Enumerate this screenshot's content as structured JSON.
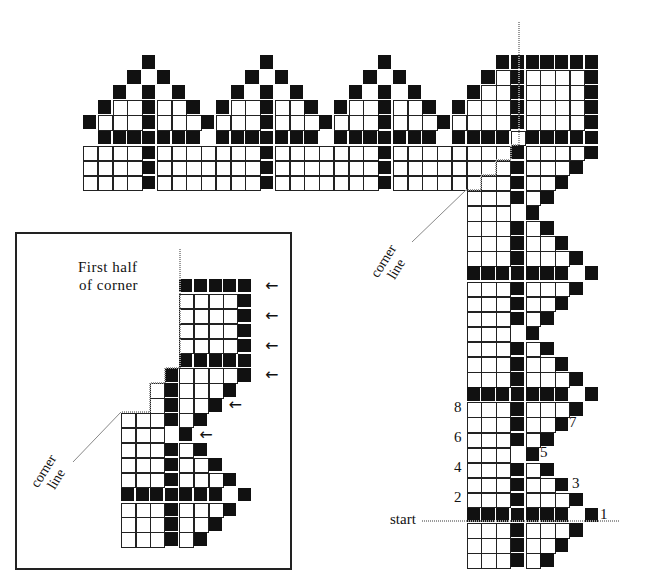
{
  "diagram": {
    "colors": {
      "filled": "#111111",
      "empty_cell_border": "#222222",
      "guide_line": "#999999"
    },
    "main_chart": {
      "origin_x": 83,
      "origin_y": 55,
      "cell_w": 14.75,
      "cell_h": 15.1,
      "legend": "# = filled square, o = open square, . = blank",
      "rows": [
        "....#.......#.......#.......#######",
        "...#.#.....#.#.....#.#.....#o#oooo#",
        "..#.#.#...#.#.#...#.#.#...#oo#oooo#",
        ".#oo#oo#.#oo#oo#.#oo#oo#.#ooo#oooo#",
        "#ooo#ooo#ooo#ooo#ooo#ooo#oooo#oooo#",
        ".#######.#######.#######.####o#####",
        "oooo#ooooooo#ooooooo#oooooooo#oooo#",
        "oooo#ooooooo#ooooooo#oooooooo#ooo#.",
        "oooo#ooooooo#ooooooo#oooooooo#oo#..",
        "..........................ooo#o#...",
        "..........................ooo.#....",
        "..........................ooo#o#...",
        "..........................ooo#oo#..",
        "..........................ooo#ooo#.",
        "..........................#######.#",
        "..........................ooo#ooo#.",
        "..........................ooo#oo#..",
        "..........................ooo#o#...",
        "..........................ooo.#....",
        "..........................ooo#o#...",
        "..........................ooo#oo#..",
        "..........................ooo#ooo#.",
        "..........................#######.#",
        "..........................ooo#ooo#.",
        "..........................ooo#oo#..",
        "..........................ooo#o#...",
        "..........................ooo.#....",
        "..........................ooo#o#...",
        "..........................ooo#oo#..",
        "..........................ooo#ooo#.",
        "..........................#######.#",
        "..........................ooo#ooo#.",
        "..........................ooo#oo#..",
        "..........................ooo#o#..."
      ],
      "corner_label": [
        "corner",
        "line"
      ],
      "start_label": "start",
      "row_numbers": [
        {
          "text": "1",
          "x": 600,
          "y": 506
        },
        {
          "text": "2",
          "x": 454,
          "y": 489
        },
        {
          "text": "3",
          "x": 572,
          "y": 475
        },
        {
          "text": "4",
          "x": 454,
          "y": 459
        },
        {
          "text": "5",
          "x": 540,
          "y": 444
        },
        {
          "text": "6",
          "x": 454,
          "y": 429
        },
        {
          "text": "7",
          "x": 569,
          "y": 414
        },
        {
          "text": "8",
          "x": 454,
          "y": 399
        }
      ]
    },
    "inset": {
      "title_line1": "First half",
      "title_line2": "of corner",
      "origin_x": 121,
      "origin_y": 279,
      "cell_w": 14.6,
      "cell_h": 14.9,
      "rows": [
        "....#####",
        "....oooo#",
        "....oooo#",
        "....oooo#",
        "....oooo#",
        "....#####",
        "...#oooo#",
        "..o#ooo#.",
        "..o#oo#..",
        "ooo#o#...",
        "ooo.#....",
        "ooo#o#...",
        "ooo#oo#..",
        "ooo#ooo#.",
        "#######.#",
        "ooo#ooo#.",
        "ooo#oo#..",
        "ooo#o#..."
      ],
      "arrows": [
        {
          "row": 0,
          "col": 10
        },
        {
          "row": 2,
          "col": 10
        },
        {
          "row": 4,
          "col": 10
        },
        {
          "row": 6,
          "col": 10
        },
        {
          "row": 8,
          "col": 7.5
        },
        {
          "row": 10,
          "col": 5.5
        }
      ],
      "arrow_glyph": "←",
      "corner_label": [
        "corner",
        "line"
      ]
    }
  }
}
